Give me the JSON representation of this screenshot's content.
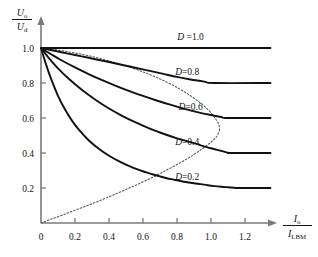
{
  "chart_data": {
    "type": "line",
    "title": "",
    "xlabel": "I_o / I_LBM",
    "ylabel": "U_o / U_d",
    "xlabel_num": "I",
    "xlabel_num_sub": "o",
    "xlabel_den": "I",
    "xlabel_den_sub": "LBM",
    "ylabel_num": "U",
    "ylabel_num_sub": "o",
    "ylabel_den": "U",
    "ylabel_den_sub": "d",
    "xlim": [
      0,
      1.35
    ],
    "ylim": [
      0,
      1.08
    ],
    "xticks": [
      0,
      0.2,
      0.4,
      0.6,
      0.8,
      1.0,
      1.2
    ],
    "xticklabels": [
      "0",
      "0.2",
      "0.4",
      "0.6",
      "0.8",
      "1.0",
      "1.2"
    ],
    "yticks": [
      0.2,
      0.4,
      0.6,
      0.8,
      1.0
    ],
    "yticklabels": [
      "0.2",
      "0.4",
      "0.6",
      "0.8",
      "1.0"
    ],
    "grid": false,
    "legend": "inline-annotations",
    "line_color": "#111111",
    "axis_color": "#7a7a7a",
    "envelope_style": "dotted",
    "envelope_color": "#555555",
    "series": [
      {
        "name": "D =1.0",
        "label": "D =1.0",
        "D": 1.0,
        "label_x": 0.88,
        "label_y": 1.045,
        "points": [
          [
            0,
            1.0
          ],
          [
            1.35,
            1.0
          ]
        ]
      },
      {
        "name": "D=0.8",
        "label": "D=0.8",
        "D": 0.8,
        "label_x": 0.86,
        "label_y": 0.845,
        "points": [
          [
            0,
            1.0
          ],
          [
            0.08,
            0.984
          ],
          [
            0.16,
            0.968
          ],
          [
            0.24,
            0.952
          ],
          [
            0.32,
            0.936
          ],
          [
            0.4,
            0.92
          ],
          [
            0.48,
            0.903
          ],
          [
            0.56,
            0.886
          ],
          [
            0.64,
            0.869
          ],
          [
            0.72,
            0.852
          ],
          [
            0.8,
            0.835
          ],
          [
            0.88,
            0.82
          ],
          [
            0.96,
            0.808
          ],
          [
            1.02,
            0.8
          ],
          [
            1.35,
            0.8
          ]
        ]
      },
      {
        "name": "D=0.6",
        "label": "D=0.6",
        "D": 0.6,
        "label_x": 0.88,
        "label_y": 0.645,
        "points": [
          [
            0,
            1.0
          ],
          [
            0.06,
            0.964
          ],
          [
            0.12,
            0.93
          ],
          [
            0.2,
            0.889
          ],
          [
            0.28,
            0.851
          ],
          [
            0.36,
            0.816
          ],
          [
            0.44,
            0.784
          ],
          [
            0.52,
            0.754
          ],
          [
            0.6,
            0.726
          ],
          [
            0.68,
            0.7
          ],
          [
            0.76,
            0.676
          ],
          [
            0.84,
            0.654
          ],
          [
            0.92,
            0.634
          ],
          [
            1.0,
            0.617
          ],
          [
            1.06,
            0.606
          ],
          [
            1.1,
            0.6
          ],
          [
            1.35,
            0.6
          ]
        ]
      },
      {
        "name": "D=0.4",
        "label": "D=0.4",
        "D": 0.4,
        "label_x": 0.86,
        "label_y": 0.445,
        "points": [
          [
            0,
            1.0
          ],
          [
            0.05,
            0.938
          ],
          [
            0.1,
            0.884
          ],
          [
            0.16,
            0.827
          ],
          [
            0.24,
            0.761
          ],
          [
            0.32,
            0.704
          ],
          [
            0.4,
            0.654
          ],
          [
            0.48,
            0.611
          ],
          [
            0.56,
            0.573
          ],
          [
            0.64,
            0.539
          ],
          [
            0.72,
            0.51
          ],
          [
            0.8,
            0.484
          ],
          [
            0.88,
            0.462
          ],
          [
            0.94,
            0.444
          ],
          [
            1.0,
            0.427
          ],
          [
            1.06,
            0.412
          ],
          [
            1.1,
            0.402
          ],
          [
            1.12,
            0.4
          ],
          [
            1.35,
            0.4
          ]
        ]
      },
      {
        "name": "D=0.2",
        "label": "D=0.2",
        "D": 0.2,
        "label_x": 0.86,
        "label_y": 0.245,
        "points": [
          [
            0,
            1.0
          ],
          [
            0.03,
            0.905
          ],
          [
            0.06,
            0.822
          ],
          [
            0.1,
            0.727
          ],
          [
            0.14,
            0.651
          ],
          [
            0.18,
            0.588
          ],
          [
            0.22,
            0.536
          ],
          [
            0.28,
            0.473
          ],
          [
            0.34,
            0.424
          ],
          [
            0.4,
            0.384
          ],
          [
            0.46,
            0.352
          ],
          [
            0.52,
            0.325
          ],
          [
            0.58,
            0.302
          ],
          [
            0.62,
            0.289
          ],
          [
            0.66,
            0.277
          ],
          [
            0.7,
            0.266
          ],
          [
            0.74,
            0.256
          ],
          [
            0.78,
            0.248
          ],
          [
            0.82,
            0.24
          ],
          [
            0.86,
            0.233
          ],
          [
            0.9,
            0.227
          ],
          [
            0.94,
            0.222
          ],
          [
            0.98,
            0.216
          ],
          [
            1.02,
            0.211
          ],
          [
            1.06,
            0.207
          ],
          [
            1.1,
            0.204
          ],
          [
            1.14,
            0.201
          ],
          [
            1.16,
            0.2
          ],
          [
            1.35,
            0.2
          ]
        ]
      }
    ],
    "envelope": {
      "name": "operating-envelope",
      "comment": "dotted locus curve from origin bulging right and returning to (0,1.0)",
      "lower_branch": [
        [
          0,
          0
        ],
        [
          0.06,
          0.022
        ],
        [
          0.13,
          0.047
        ],
        [
          0.21,
          0.077
        ],
        [
          0.3,
          0.11
        ],
        [
          0.39,
          0.146
        ],
        [
          0.48,
          0.183
        ],
        [
          0.57,
          0.222
        ],
        [
          0.66,
          0.263
        ],
        [
          0.74,
          0.303
        ],
        [
          0.82,
          0.345
        ],
        [
          0.89,
          0.385
        ],
        [
          0.95,
          0.425
        ],
        [
          1.0,
          0.462
        ],
        [
          1.035,
          0.497
        ],
        [
          1.05,
          0.53
        ]
      ],
      "upper_branch": [
        [
          1.05,
          0.53
        ],
        [
          1.045,
          0.565
        ],
        [
          1.02,
          0.605
        ],
        [
          0.985,
          0.645
        ],
        [
          0.935,
          0.688
        ],
        [
          0.875,
          0.73
        ],
        [
          0.805,
          0.772
        ],
        [
          0.725,
          0.812
        ],
        [
          0.635,
          0.85
        ],
        [
          0.535,
          0.886
        ],
        [
          0.43,
          0.918
        ],
        [
          0.325,
          0.946
        ],
        [
          0.22,
          0.968
        ],
        [
          0.12,
          0.985
        ],
        [
          0.045,
          0.996
        ],
        [
          0,
          1.0
        ]
      ]
    }
  }
}
